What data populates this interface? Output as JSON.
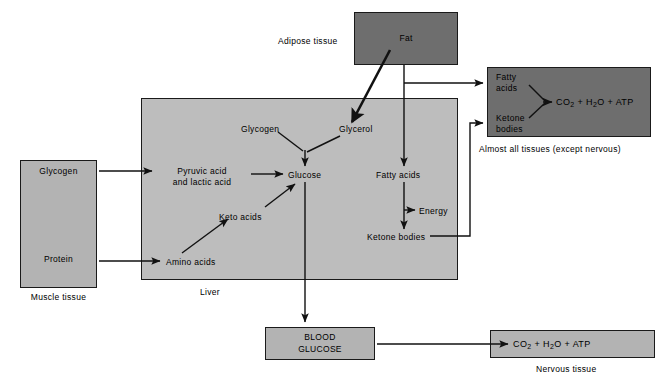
{
  "diagram": {
    "colors": {
      "background": "#ffffff",
      "box_mid_gray": "#b3b3b3",
      "box_dark_gray": "#6e6e6e",
      "box_liver_gray": "#bdbdbd",
      "stroke": "#1a1a1a",
      "text": "#000000"
    },
    "tissues": {
      "muscle": {
        "caption": "Muscle tissue",
        "items": [
          "Glycogen",
          "Protein"
        ]
      },
      "adipose": {
        "caption": "Adipose tissue",
        "box_label": "Fat"
      },
      "liver": {
        "caption": "Liver",
        "nodes": [
          "Pyruvic acid",
          "and lactic acid",
          "Glycogen",
          "Glycerol",
          "Glucose",
          "Keto acids",
          "Amino acids",
          "Fatty acids",
          "Energy",
          "Ketone bodies"
        ]
      },
      "all_tissues": {
        "caption": "Almost all tissues (except nervous)",
        "input_1_line_1": "Fatty",
        "input_1_line_2": "acids",
        "input_2_line_1": "Ketone",
        "input_2_line_2": "bodies",
        "product": "CO2 + H2O + ATP"
      },
      "nervous": {
        "caption": "Nervous tissue",
        "product": "CO2 + H2O + ATP"
      },
      "blood": {
        "line_1": "BLOOD",
        "line_2": "GLUCOSE"
      }
    }
  }
}
